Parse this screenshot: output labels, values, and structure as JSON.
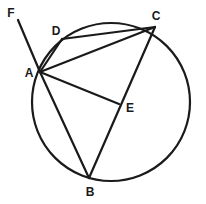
{
  "figure": {
    "kind": "circle-geometry-diagram",
    "background_color": "#ffffff",
    "stroke_color": "#1a1a1a",
    "label_color": "#1a1a1a",
    "circle": {
      "cx": 111,
      "cy": 102,
      "r": 79,
      "stroke_width": 2.2
    },
    "points": [
      {
        "id": "A",
        "label": "A",
        "x": 40,
        "y": 72,
        "label_x": 29,
        "label_y": 73,
        "on_circle": true
      },
      {
        "id": "B",
        "label": "B",
        "x": 89,
        "y": 178,
        "label_x": 90,
        "label_y": 192,
        "on_circle": true
      },
      {
        "id": "C",
        "label": "C",
        "x": 155,
        "y": 27,
        "label_x": 156,
        "label_y": 16,
        "on_circle": true
      },
      {
        "id": "D",
        "label": "D",
        "x": 62,
        "y": 39,
        "label_x": 56,
        "label_y": 31,
        "on_circle": true
      },
      {
        "id": "E",
        "label": "E",
        "x": 119,
        "y": 104,
        "label_x": 130,
        "label_y": 108,
        "on_circle": false
      },
      {
        "id": "F",
        "label": "F",
        "x": 18,
        "y": 20,
        "label_x": 11,
        "label_y": 13,
        "on_circle": false
      }
    ],
    "segments": [
      {
        "id": "FA",
        "from": "F",
        "to": "A",
        "x1": 18,
        "y1": 20,
        "x2": 40,
        "y2": 72,
        "stroke_width": 2.2
      },
      {
        "id": "AD",
        "from": "A",
        "to": "D",
        "x1": 40,
        "y1": 72,
        "x2": 62,
        "y2": 39,
        "stroke_width": 2.2
      },
      {
        "id": "AC",
        "from": "A",
        "to": "C",
        "x1": 40,
        "y1": 72,
        "x2": 155,
        "y2": 27,
        "stroke_width": 2.2
      },
      {
        "id": "DC",
        "from": "D",
        "to": "C",
        "x1": 62,
        "y1": 39,
        "x2": 155,
        "y2": 27,
        "stroke_width": 2.2
      },
      {
        "id": "AE",
        "from": "A",
        "to": "E",
        "x1": 40,
        "y1": 72,
        "x2": 119,
        "y2": 104,
        "stroke_width": 2.2
      },
      {
        "id": "AB",
        "from": "A",
        "to": "B",
        "x1": 40,
        "y1": 72,
        "x2": 89,
        "y2": 178,
        "stroke_width": 2.2
      },
      {
        "id": "BC",
        "from": "B",
        "to": "C",
        "x1": 89,
        "y1": 178,
        "x2": 155,
        "y2": 27,
        "stroke_width": 2.2
      }
    ]
  }
}
